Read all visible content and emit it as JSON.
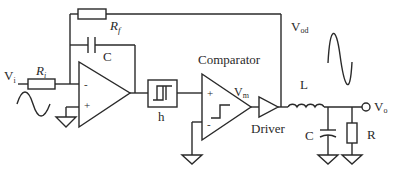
{
  "diagram": {
    "labels": {
      "input": "V",
      "input_sub": "i",
      "input_resistor": "R",
      "input_resistor_sub": "i",
      "feedback_resistor": "R",
      "feedback_resistor_sub": "f",
      "integrator_cap": "C",
      "opamp_minus": "-",
      "opamp_plus": "+",
      "hysteresis_block": "h",
      "comparator_title": "Comparator",
      "comparator_plus": "+",
      "comparator_minus": "-",
      "comparator_output": "V",
      "comparator_output_sub": "m",
      "driver": "Driver",
      "driver_output": "V",
      "driver_output_sub": "od",
      "inductor": "L",
      "filter_cap": "C",
      "load_resistor": "R",
      "output": "V",
      "output_sub": "o"
    },
    "colors": {
      "line": "#2a2a2a",
      "background": "#ffffff"
    }
  }
}
